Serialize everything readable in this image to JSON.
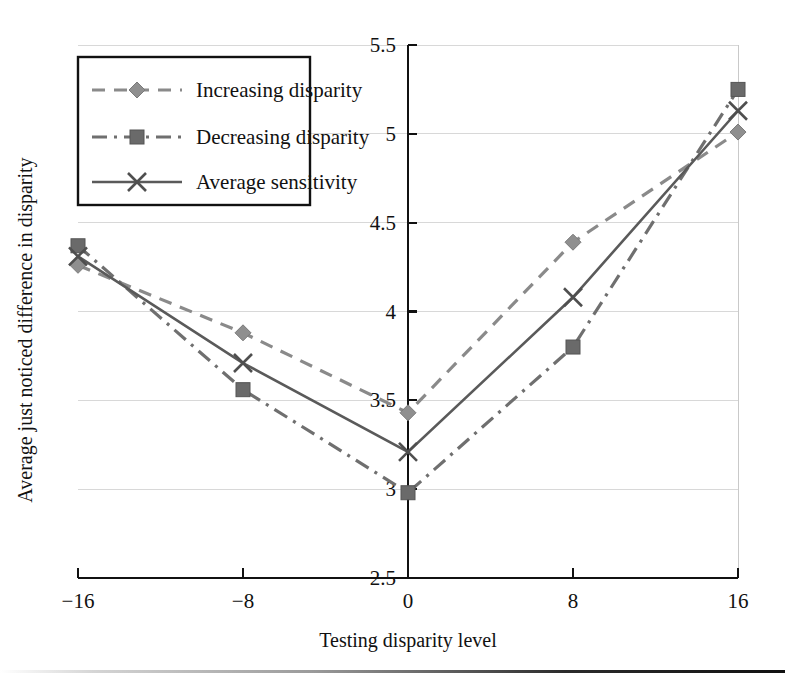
{
  "chart_data": {
    "type": "line",
    "title": "",
    "xlabel": "Testing disparity level",
    "ylabel": "Average just noticed difference in disparity",
    "x": [
      -16,
      -8,
      0,
      8,
      16
    ],
    "xtick_labels": [
      "−16",
      "−8",
      "0",
      "8",
      "16"
    ],
    "xlim": [
      -16,
      16
    ],
    "ylim": [
      2.5,
      5.5
    ],
    "ytick_values": [
      2.5,
      3,
      3.5,
      4,
      4.5,
      5,
      5.5
    ],
    "ytick_labels": [
      "2.5",
      "3",
      "3.5",
      "4",
      "4.5",
      "5",
      "5.5"
    ],
    "grid": "horizontal",
    "legend_position": "upper-left",
    "yaxis_position": "x=0",
    "series": [
      {
        "name": "Increasing disparity",
        "values": [
          4.26,
          3.88,
          3.43,
          4.39,
          5.01
        ],
        "line_style": "dashed",
        "marker": "diamond",
        "color": "#8f8f8f"
      },
      {
        "name": "Decreasing disparity",
        "values": [
          4.37,
          3.56,
          2.98,
          3.8,
          5.25
        ],
        "line_style": "dash-dot",
        "marker": "square",
        "color": "#6a6a6a"
      },
      {
        "name": "Average sensitivity",
        "values": [
          4.31,
          3.71,
          3.21,
          4.08,
          5.13
        ],
        "line_style": "solid",
        "marker": "cross",
        "color": "#5a5a5a"
      }
    ]
  },
  "legend": {
    "items": [
      {
        "label": "Increasing disparity"
      },
      {
        "label": "Decreasing disparity"
      },
      {
        "label": "Average sensitivity"
      }
    ]
  },
  "axes": {
    "x_title": "Testing disparity level",
    "y_title": "Average just noticed difference in disparity"
  }
}
